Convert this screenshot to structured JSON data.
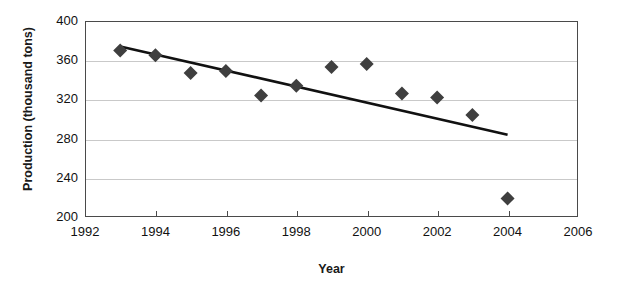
{
  "chart_data": {
    "type": "scatter",
    "title": "",
    "xlabel": "Year",
    "ylabel": "Production (thousand tons)",
    "xlim": [
      1992,
      2006
    ],
    "ylim": [
      200,
      400
    ],
    "xticks": [
      1992,
      1994,
      1996,
      1998,
      2000,
      2002,
      2004,
      2006
    ],
    "yticks": [
      200,
      240,
      280,
      320,
      360,
      400
    ],
    "grid": "horizontal",
    "legend": "none",
    "marker_shape": "diamond",
    "marker_color": "#3f3f3f",
    "trendline_color": "#111111",
    "x": [
      1993,
      1994,
      1995,
      1996,
      1997,
      1998,
      1999,
      2000,
      2001,
      2002,
      2003,
      2004
    ],
    "values": [
      370,
      365,
      347,
      349,
      324,
      334,
      353,
      356,
      326,
      322,
      304,
      219
    ],
    "series": [
      {
        "name": "Production",
        "points": [
          {
            "x": 1993,
            "y": 370
          },
          {
            "x": 1994,
            "y": 365
          },
          {
            "x": 1995,
            "y": 347
          },
          {
            "x": 1996,
            "y": 349
          },
          {
            "x": 1997,
            "y": 324
          },
          {
            "x": 1998,
            "y": 334
          },
          {
            "x": 1999,
            "y": 353
          },
          {
            "x": 2000,
            "y": 356
          },
          {
            "x": 2001,
            "y": 326
          },
          {
            "x": 2002,
            "y": 322
          },
          {
            "x": 2003,
            "y": 304
          },
          {
            "x": 2004,
            "y": 219
          }
        ]
      },
      {
        "name": "Trend line",
        "type": "line",
        "points": [
          {
            "x": 1993,
            "y": 374
          },
          {
            "x": 2004,
            "y": 284
          }
        ]
      }
    ]
  },
  "axis": {
    "x_title": "Year",
    "y_title": "Production (thousand tons)",
    "x_tick_labels": [
      "1992",
      "1994",
      "1996",
      "1998",
      "2000",
      "2002",
      "2004",
      "2006"
    ],
    "y_tick_labels": [
      "400",
      "360",
      "320",
      "280",
      "240",
      "200"
    ]
  }
}
